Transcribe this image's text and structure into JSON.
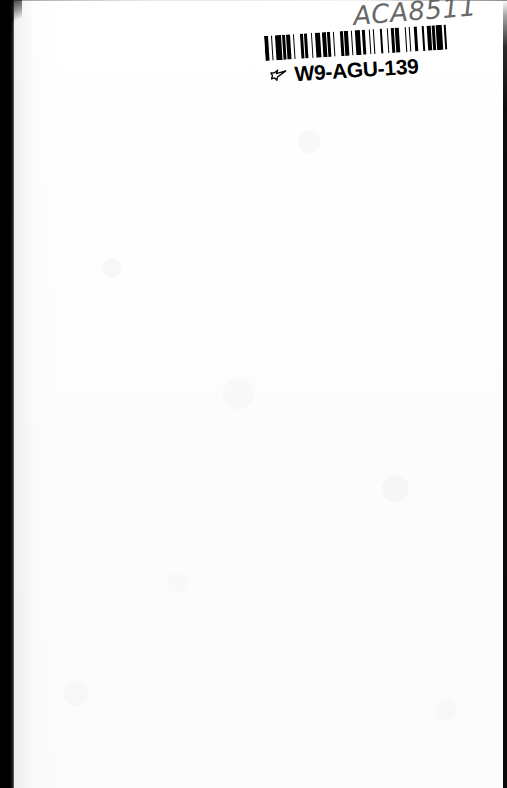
{
  "page": {
    "kind": "scanned-book-page",
    "width": 507,
    "height": 788,
    "background_color": "#fefefe",
    "body_text": ""
  },
  "annotations": {
    "handwritten_call_number": "ACA8511"
  },
  "barcode_label": {
    "human_readable_text": "W9-AGU-139",
    "pointer_icon_name": "pointing-hand-icon",
    "bar_color": "#000000",
    "bar_widths": [
      3,
      2,
      1,
      2,
      4,
      1,
      2,
      1,
      3,
      2,
      1,
      4,
      2,
      1,
      2,
      3,
      1,
      2,
      4,
      1,
      3,
      1,
      2,
      2,
      1,
      4,
      2,
      1,
      3,
      2,
      1,
      2,
      4,
      1,
      2,
      3,
      1,
      2,
      1,
      4,
      2,
      3,
      1,
      2,
      2,
      1,
      3,
      4,
      1,
      2,
      1,
      3,
      2,
      4,
      1,
      2,
      3,
      1,
      2,
      1,
      4,
      2,
      1,
      3
    ]
  },
  "scan_artifacts": {
    "left_edge_color": "#000000",
    "right_edge_color": "#0a0a0a"
  }
}
